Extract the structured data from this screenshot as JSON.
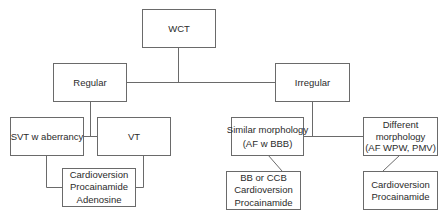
{
  "diagram": {
    "root": {
      "label": "WCT"
    },
    "branches": [
      {
        "label": "Regular",
        "children": [
          {
            "label": "SVT w aberrancy"
          },
          {
            "label": "VT"
          }
        ],
        "treatment": [
          "Cardioversion",
          "Procainamide",
          "Adenosine"
        ]
      },
      {
        "label": "Irregular",
        "children": [
          {
            "lines": [
              "Similar morphology",
              "(AF w BBB)"
            ],
            "treatment": [
              "BB or CCB",
              "Cardioversion",
              "Procainamide"
            ]
          },
          {
            "lines": [
              "Different",
              "morphology",
              "(AF WPW, PMV)"
            ],
            "treatment": [
              "Cardioversion",
              "Procainamide"
            ]
          }
        ]
      }
    ]
  },
  "colors": {
    "line": "#6a6a6a",
    "text": "#2b2b2b",
    "background": "#ffffff"
  }
}
